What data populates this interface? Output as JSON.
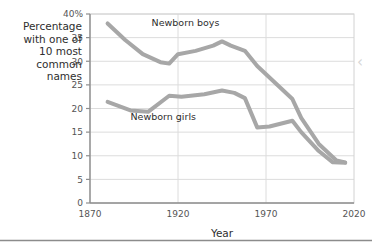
{
  "chart_data": {
    "type": "line",
    "title": "",
    "xlabel": "Year",
    "ylabel": "Percentage with one of 10 most common names",
    "ylabel_lines": [
      "Percentage",
      "with one of",
      "10 most",
      "common",
      "names"
    ],
    "xlim": [
      1870,
      2020
    ],
    "ylim": [
      0,
      40
    ],
    "xticks": [
      1870,
      1920,
      1970,
      2020
    ],
    "xtick_labels": [
      "1870",
      "1920",
      "1970",
      "2020"
    ],
    "yticks": [
      0,
      5,
      10,
      15,
      20,
      25,
      30,
      35,
      40
    ],
    "ytick_labels": [
      "0",
      "5",
      "10",
      "15",
      "20",
      "25",
      "30",
      "35",
      "40%"
    ],
    "grid": true,
    "legend_position": "inline-annotations",
    "line_color": "#a7a7a7",
    "line_width": 4,
    "series": [
      {
        "name": "Newborn boys",
        "label": "Newborn boys",
        "label_x": 1905,
        "label_y": 37.5,
        "color": "#a7a7a7",
        "x": [
          1880,
          1890,
          1900,
          1910,
          1915,
          1920,
          1930,
          1940,
          1945,
          1950,
          1958,
          1965,
          1975,
          1985,
          1990,
          2000,
          2010,
          2015
        ],
        "values": [
          38.0,
          34.5,
          31.5,
          29.8,
          29.5,
          31.5,
          32.2,
          33.3,
          34.2,
          33.3,
          32.2,
          29.0,
          25.5,
          22.0,
          18.0,
          12.5,
          9.0,
          8.6
        ]
      },
      {
        "name": "Newborn girls",
        "label": "Newborn girls",
        "label_x": 1893,
        "label_y": 17.6,
        "color": "#a7a7a7",
        "x": [
          1880,
          1893,
          1903,
          1915,
          1922,
          1935,
          1945,
          1952,
          1958,
          1965,
          1972,
          1985,
          1990,
          2000,
          2008,
          2015
        ],
        "values": [
          21.4,
          19.6,
          19.3,
          22.7,
          22.5,
          23.0,
          23.8,
          23.3,
          22.2,
          16.0,
          16.2,
          17.4,
          15.0,
          11.0,
          8.6,
          8.5
        ]
      }
    ]
  },
  "decor": {
    "right_chevron_glyph": "‹",
    "divider_color": "#8c8c8c"
  }
}
